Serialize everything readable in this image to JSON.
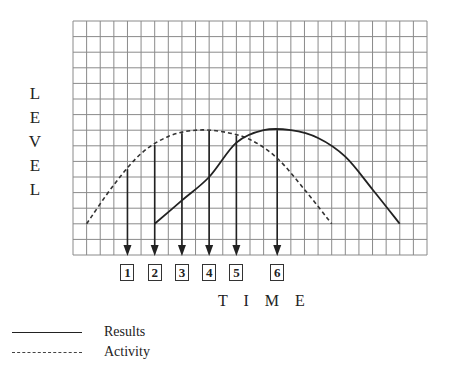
{
  "chart_data": {
    "type": "line",
    "title": "",
    "xlabel": "TIME",
    "ylabel": "LEVEL",
    "grid": true,
    "grid_columns": 26,
    "grid_rows": 15,
    "xlim": [
      0,
      26
    ],
    "ylim": [
      0,
      15
    ],
    "legend_position": "bottom-left",
    "series": [
      {
        "name": "Results",
        "style": "solid",
        "points": [
          [
            6,
            2
          ],
          [
            8,
            3.5
          ],
          [
            10,
            5
          ],
          [
            12,
            7.2
          ],
          [
            14,
            8
          ],
          [
            16,
            8
          ],
          [
            18,
            7.5
          ],
          [
            20,
            6.3
          ],
          [
            22,
            4.2
          ],
          [
            24,
            2
          ]
        ]
      },
      {
        "name": "Activity",
        "style": "dashed",
        "points": [
          [
            1,
            2
          ],
          [
            3,
            4.5
          ],
          [
            5,
            6.5
          ],
          [
            7,
            7.6
          ],
          [
            9,
            8
          ],
          [
            11,
            7.9
          ],
          [
            13,
            7.4
          ],
          [
            15,
            6.2
          ],
          [
            17,
            4.2
          ],
          [
            19,
            2
          ]
        ]
      }
    ],
    "markers": [
      {
        "label": "1",
        "x": 4
      },
      {
        "label": "2",
        "x": 6
      },
      {
        "label": "3",
        "x": 8
      },
      {
        "label": "4",
        "x": 10
      },
      {
        "label": "5",
        "x": 12
      },
      {
        "label": "6",
        "x": 15
      }
    ]
  },
  "labels": {
    "ylabel_letters": [
      "L",
      "E",
      "V",
      "E",
      "L"
    ],
    "xlabel": "T I M E"
  },
  "legend": {
    "items": [
      {
        "label": "Results",
        "style": "solid"
      },
      {
        "label": "Activity",
        "style": "dashed"
      }
    ]
  }
}
